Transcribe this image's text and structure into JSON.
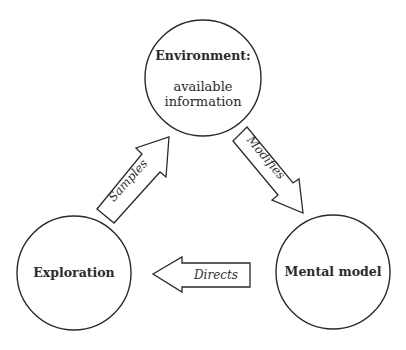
{
  "diagram": {
    "nodes": [
      {
        "id": "environment",
        "title": "Environment:",
        "subtitle_line1": "available",
        "subtitle_line2": "information"
      },
      {
        "id": "exploration",
        "title": "Exploration"
      },
      {
        "id": "mental_model",
        "title": "Mental model"
      }
    ],
    "edges": [
      {
        "from": "exploration",
        "to": "environment",
        "label": "Samples"
      },
      {
        "from": "environment",
        "to": "mental_model",
        "label": "Modifies"
      },
      {
        "from": "mental_model",
        "to": "exploration",
        "label": "Directs"
      }
    ],
    "colors": {
      "stroke": "#2a2a2a",
      "fill": "#ffffff",
      "text": "#2a2a2a"
    }
  }
}
